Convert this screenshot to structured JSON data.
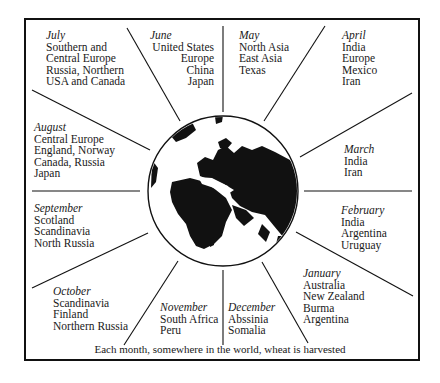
{
  "diagram": {
    "caption": "Each month, somewhere in the world, wheat is harvested",
    "center": "globe-eurafrica",
    "months": [
      {
        "id": "july",
        "month": "July",
        "regions": [
          "Southern and",
          "Central Europe",
          "Russia, Northern",
          "USA and Canada"
        ]
      },
      {
        "id": "june",
        "month": "June",
        "regions": [
          "United States",
          "Europe",
          "China",
          "Japan"
        ]
      },
      {
        "id": "may",
        "month": "May",
        "regions": [
          "North Asia",
          "East Asia",
          "Texas"
        ]
      },
      {
        "id": "april",
        "month": "April",
        "regions": [
          "India",
          "Europe",
          "Mexico",
          "Iran"
        ]
      },
      {
        "id": "march",
        "month": "March",
        "regions": [
          "India",
          "Iran"
        ]
      },
      {
        "id": "february",
        "month": "February",
        "regions": [
          "India",
          "Argentina",
          "Uruguay"
        ]
      },
      {
        "id": "january",
        "month": "January",
        "regions": [
          "Australia",
          "New Zealand",
          "Burma",
          "Argentina"
        ]
      },
      {
        "id": "december",
        "month": "December",
        "regions": [
          "Abssinia",
          "Somalia"
        ]
      },
      {
        "id": "november",
        "month": "November",
        "regions": [
          "South Africa",
          "Peru"
        ]
      },
      {
        "id": "october",
        "month": "October",
        "regions": [
          "Scandinavia",
          "Finland",
          "Northern Russia"
        ]
      },
      {
        "id": "september",
        "month": "September",
        "regions": [
          "Scotland",
          "Scandinavia",
          "North Russia"
        ]
      },
      {
        "id": "august",
        "month": "August",
        "regions": [
          "Central Europe",
          "England, Norway",
          "Canada, Russia",
          "Japan"
        ]
      }
    ]
  }
}
